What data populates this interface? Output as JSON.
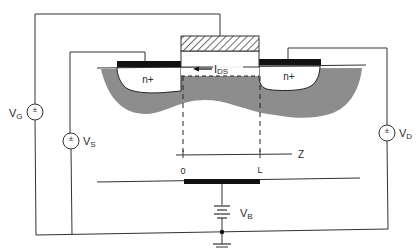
{
  "diagram": {
    "regions": {
      "source": "n+",
      "drain": "n+"
    },
    "current_label": "I",
    "current_subscript": "DS",
    "axis": {
      "label": "Z",
      "tick_start": "0",
      "tick_end": "L"
    },
    "sources": {
      "gate": {
        "label": "V",
        "sub": "G",
        "symbol": "±"
      },
      "source": {
        "label": "V",
        "sub": "S",
        "symbol": "±"
      },
      "drain": {
        "label": "V",
        "sub": "D",
        "symbol": "±"
      },
      "bulk": {
        "label": "V",
        "sub": "B"
      }
    },
    "colors": {
      "depletion": "#8a8a8a",
      "metal": "#111111",
      "wire": "#333333",
      "background": "#ffffff"
    }
  }
}
